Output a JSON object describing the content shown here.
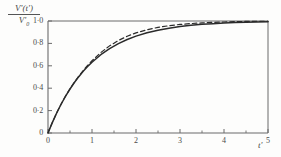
{
  "chart_data": {
    "type": "line",
    "title": "",
    "ylabel_numerator": "V'(t')",
    "ylabel_denominator": "V'",
    "ylabel_denominator_sub": "0",
    "xlabel": "t'",
    "xlim": [
      0,
      5
    ],
    "ylim": [
      0,
      1.0
    ],
    "grid": false,
    "legend": "none",
    "frame": "top-and-right-border",
    "x_ticks": [
      0,
      1,
      2,
      3,
      4,
      5
    ],
    "x_tick_labels": [
      "0",
      "1",
      "2",
      "3",
      "4",
      "5"
    ],
    "x_minor_ticks": [
      0.5,
      1.5,
      2.5,
      3.5,
      4.5
    ],
    "y_ticks": [
      0,
      0.2,
      0.4,
      0.6,
      0.8,
      1.0
    ],
    "y_tick_labels": [
      "0",
      "0·2",
      "0·4",
      "0·6",
      "0·8",
      "1·0"
    ],
    "x": [
      0,
      0.1,
      0.2,
      0.3,
      0.4,
      0.5,
      0.6,
      0.7,
      0.8,
      0.9,
      1.0,
      1.2,
      1.4,
      1.6,
      1.8,
      2.0,
      2.25,
      2.5,
      2.75,
      3.0,
      3.25,
      3.5,
      3.75,
      4.0,
      4.25,
      4.5,
      4.75,
      5.0
    ],
    "series": [
      {
        "name": "solid-curve",
        "style": "solid",
        "color": "#2b2b2b",
        "values": [
          0,
          0.095,
          0.181,
          0.259,
          0.33,
          0.393,
          0.451,
          0.503,
          0.551,
          0.593,
          0.632,
          0.699,
          0.753,
          0.798,
          0.835,
          0.865,
          0.895,
          0.918,
          0.936,
          0.95,
          0.961,
          0.97,
          0.976,
          0.982,
          0.986,
          0.989,
          0.991,
          0.993
        ]
      },
      {
        "name": "dashed-curve",
        "style": "dashed",
        "color": "#2b2b2b",
        "values": [
          0,
          0.095,
          0.181,
          0.259,
          0.331,
          0.395,
          0.454,
          0.508,
          0.558,
          0.603,
          0.645,
          0.718,
          0.778,
          0.826,
          0.864,
          0.894,
          0.922,
          0.943,
          0.958,
          0.969,
          0.977,
          0.983,
          0.988,
          0.991,
          0.994,
          0.996,
          0.997,
          0.998
        ]
      }
    ]
  }
}
